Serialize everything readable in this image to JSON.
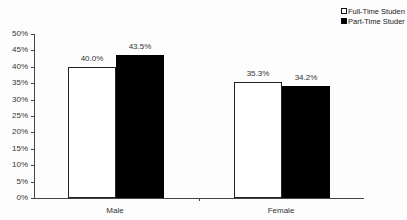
{
  "chart_data": {
    "type": "bar",
    "title": "",
    "xlabel": "",
    "ylabel": "",
    "categories": [
      "Male",
      "Female"
    ],
    "series": [
      {
        "name": "Full-Time Studen",
        "values": [
          40.0,
          35.3
        ],
        "labels": [
          "40.0%",
          "35.3%"
        ],
        "color": "#ffffff"
      },
      {
        "name": "Part-Time Studer",
        "values": [
          43.5,
          34.2
        ],
        "labels": [
          "43.5%",
          "34.2%"
        ],
        "color": "#000000"
      }
    ],
    "ylim": [
      0,
      50
    ],
    "yticks": [
      "0%",
      "5%",
      "10%",
      "15%",
      "20%",
      "25%",
      "30%",
      "35%",
      "40%",
      "45%",
      "50%"
    ],
    "grid": false,
    "legend_position": "top-right"
  },
  "legend": {
    "items": [
      {
        "label": "Full-Time Studen"
      },
      {
        "label": "Part-Time Studer"
      }
    ]
  }
}
